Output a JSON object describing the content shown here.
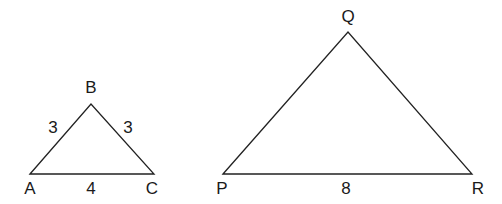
{
  "diagram": {
    "type": "similar-triangles",
    "triangles": [
      {
        "id": "ABC",
        "vertices": {
          "A": {
            "label": "A",
            "x": 30,
            "y": 174
          },
          "B": {
            "label": "B",
            "x": 91,
            "y": 104
          },
          "C": {
            "label": "C",
            "x": 154,
            "y": 174
          }
        },
        "sides": {
          "AB": "3",
          "BC": "3",
          "AC": "4"
        }
      },
      {
        "id": "PQR",
        "vertices": {
          "P": {
            "label": "P",
            "x": 223,
            "y": 174
          },
          "Q": {
            "label": "Q",
            "x": 348,
            "y": 32
          },
          "R": {
            "label": "R",
            "x": 472,
            "y": 174
          }
        },
        "sides": {
          "PR": "8"
        }
      }
    ]
  }
}
